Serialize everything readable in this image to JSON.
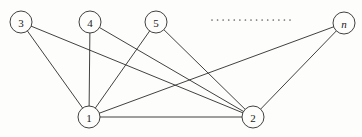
{
  "figure": {
    "background_color": "#fdfdfb",
    "stroke_color": "#2b2b2b",
    "label_color": "#1a1a1a",
    "width": 362,
    "height": 137
  },
  "chart_data": {
    "type": "diagram",
    "subtype": "node-link-graph",
    "title": "",
    "nodes": [
      {
        "id": "n3",
        "label": "3",
        "x": 21,
        "y": 22,
        "r": 11,
        "italic": false
      },
      {
        "id": "n4",
        "label": "4",
        "x": 90,
        "y": 22,
        "r": 11,
        "italic": false
      },
      {
        "id": "n5",
        "label": "5",
        "x": 156,
        "y": 22,
        "r": 11,
        "italic": false
      },
      {
        "id": "nn",
        "label": "n",
        "x": 344,
        "y": 23,
        "r": 11,
        "italic": true
      },
      {
        "id": "n1",
        "label": "1",
        "x": 89,
        "y": 117,
        "r": 11,
        "italic": false
      },
      {
        "id": "n2",
        "label": "2",
        "x": 253,
        "y": 117,
        "r": 11,
        "italic": false
      }
    ],
    "edges": [
      {
        "from": "n3",
        "to": "n1"
      },
      {
        "from": "n3",
        "to": "n2"
      },
      {
        "from": "n4",
        "to": "n1"
      },
      {
        "from": "n4",
        "to": "n2"
      },
      {
        "from": "n5",
        "to": "n1"
      },
      {
        "from": "n5",
        "to": "n2"
      },
      {
        "from": "nn",
        "to": "n1"
      },
      {
        "from": "nn",
        "to": "n2"
      },
      {
        "from": "n1",
        "to": "n2"
      }
    ],
    "ellipsis": {
      "label": "..............",
      "x_start": 212,
      "x_end": 290,
      "y": 20,
      "dot_count": 15,
      "color": "#6a6a6a"
    },
    "node_count_visible": 6,
    "edge_count": 9
  }
}
